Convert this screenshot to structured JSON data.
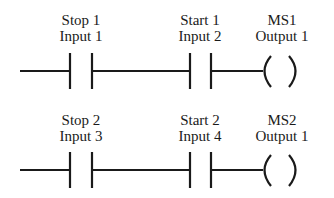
{
  "diagram": {
    "type": "ladder-logic",
    "stroke_color": "#1a1a1a",
    "background": "#ffffff",
    "rungs": [
      {
        "elements": [
          {
            "kind": "contact-no",
            "name": "Stop 1",
            "address": "Input 1"
          },
          {
            "kind": "contact-no",
            "name": "Start 1",
            "address": "Input 2"
          },
          {
            "kind": "coil",
            "name": "MS1",
            "address": "Output 1"
          }
        ]
      },
      {
        "elements": [
          {
            "kind": "contact-no",
            "name": "Stop 2",
            "address": "Input 3"
          },
          {
            "kind": "contact-no",
            "name": "Start 2",
            "address": "Input 4"
          },
          {
            "kind": "coil",
            "name": "MS2",
            "address": "Output 1"
          }
        ]
      }
    ]
  }
}
